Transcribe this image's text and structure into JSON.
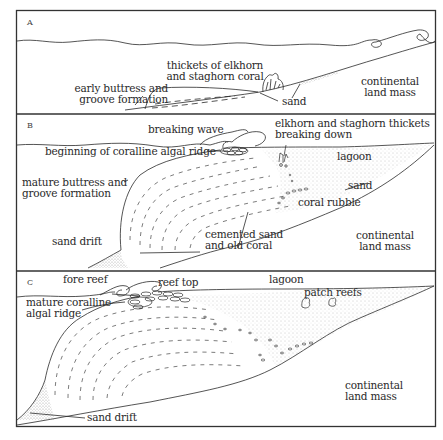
{
  "figure": {
    "panels": [
      {
        "id": "A",
        "letter": "A",
        "labels": {
          "thickets_1": "thickets of elkhorn",
          "thickets_2": "and staghorn coral",
          "buttress_1": "early buttress and",
          "buttress_2": "groove formation",
          "sand": "sand",
          "land_1": "continental",
          "land_2": "land mass"
        }
      },
      {
        "id": "B",
        "letter": "B",
        "labels": {
          "wave": "breaking wave",
          "thickets_1": "elkhorn and staghorn thickets",
          "thickets_2": "breaking down",
          "algal": "beginning of coralline algal ridge",
          "lagoon": "lagoon",
          "buttress_1": "mature buttress and",
          "buttress_2": "groove formation",
          "sand": "sand",
          "rubble": "coral rubble",
          "drift": "sand drift",
          "cemented_1": "cemented sand",
          "cemented_2": "and old coral",
          "land_1": "continental",
          "land_2": "land mass"
        }
      },
      {
        "id": "C",
        "letter": "C",
        "labels": {
          "fore": "fore reef",
          "top": "reef top",
          "lagoon": "lagoon",
          "patch": "patch reefs",
          "algal_1": "mature coralline",
          "algal_2": "algal ridge",
          "land_1": "continental",
          "land_2": "land mass",
          "drift": "sand drift"
        }
      }
    ]
  },
  "colors": {
    "line": "#2a2a2a",
    "stipple": "#9a9a9a",
    "frame": "#333333"
  }
}
